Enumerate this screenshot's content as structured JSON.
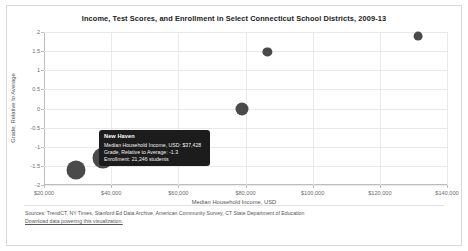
{
  "chart_data": {
    "type": "scatter",
    "title": "Income, Test Scores, and Enrollment in Select Connecticut School Districts, 2009-13",
    "xlabel": "Median Household Income, USD",
    "ylabel": "Grade, Relative to Average",
    "xlim": [
      20000,
      140000
    ],
    "ylim": [
      -2,
      2
    ],
    "grid": true,
    "legend": "none",
    "size_encodes": "Enrollment (students)",
    "xticks": [
      {
        "value": 20000,
        "label": "$20,000"
      },
      {
        "value": 40000,
        "label": "$40,000"
      },
      {
        "value": 60000,
        "label": "$60,000"
      },
      {
        "value": 80000,
        "label": "$80,000"
      },
      {
        "value": 100000,
        "label": "$100,000"
      },
      {
        "value": 120000,
        "label": "$120,000"
      },
      {
        "value": 140000,
        "label": "$140,000"
      }
    ],
    "yticks": [
      {
        "value": 2,
        "label": "2"
      },
      {
        "value": 1.5,
        "label": "1.5"
      },
      {
        "value": 1,
        "label": "1"
      },
      {
        "value": 0.5,
        "label": "0.5"
      },
      {
        "value": 0,
        "label": "0"
      },
      {
        "value": -0.5,
        "label": "-0.5"
      },
      {
        "value": -1,
        "label": "-1"
      },
      {
        "value": -1.5,
        "label": "-1.5"
      },
      {
        "value": -2,
        "label": "-2"
      }
    ],
    "points": [
      {
        "name": "New Haven",
        "x": 37428,
        "y": -1.3,
        "enrollment": 21246,
        "r": 10.5
      },
      {
        "name": "",
        "x": 29500,
        "y": -1.62,
        "enrollment": 19000,
        "r": 9.5
      },
      {
        "name": "",
        "x": 79000,
        "y": 0.0,
        "enrollment": 9000,
        "r": 6.5
      },
      {
        "name": "",
        "x": 86500,
        "y": 1.47,
        "enrollment": 4600,
        "r": 4.6
      },
      {
        "name": "",
        "x": 131500,
        "y": 1.9,
        "enrollment": 4200,
        "r": 4.4
      }
    ]
  },
  "tooltip": {
    "title": "New Haven",
    "rows": [
      "Median Household Income, USD: $37,428",
      "Grade, Relative to Average: -1.3",
      "Enrollment: 21,246 students"
    ]
  },
  "footer": {
    "sources": "Sources: TrendCT, NY Times, Stanford Ed Data Archive, American Community Survey, CT State Department of Education",
    "download_label": "Download data powering this visualization."
  }
}
